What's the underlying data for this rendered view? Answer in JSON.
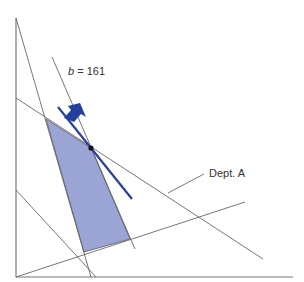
{
  "diagram": {
    "type": "linear-programming-feasible-region",
    "objective_label_var": "b",
    "objective_label_eq": " = 161",
    "constraint_label": "Dept. A",
    "colors": {
      "feasible_region": "#9aa5d6",
      "objective_line": "#2b3f9b",
      "arrow": "#23409c",
      "constraint_lines": "#666666",
      "axes": "#777777",
      "optimum_point": "#111111"
    }
  }
}
